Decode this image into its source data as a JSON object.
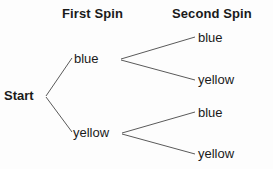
{
  "diagram": {
    "type": "probability-tree",
    "title": "",
    "background_color": "#fdfdfd",
    "line_color": "#5a5a5a",
    "text_color": "#1a1a1a"
  },
  "headers": {
    "first": "First Spin",
    "second": "Second Spin"
  },
  "nodes": {
    "root": "Start",
    "first_spin": {
      "blue": "blue",
      "yellow": "yellow"
    },
    "second_spin": {
      "from_blue": {
        "blue": "blue",
        "yellow": "yellow"
      },
      "from_yellow": {
        "blue": "blue",
        "yellow": "yellow"
      }
    }
  },
  "edges": [
    {
      "name": "start-to-blue",
      "x1": 46,
      "y1": 96,
      "x2": 72,
      "y2": 58
    },
    {
      "name": "start-to-yellow",
      "x1": 46,
      "y1": 97,
      "x2": 72,
      "y2": 132
    },
    {
      "name": "blue-to-blue",
      "x1": 121,
      "y1": 59,
      "x2": 195,
      "y2": 37
    },
    {
      "name": "blue-to-yellow",
      "x1": 121,
      "y1": 60,
      "x2": 195,
      "y2": 80
    },
    {
      "name": "yellow-to-blue",
      "x1": 122,
      "y1": 133,
      "x2": 195,
      "y2": 112
    },
    {
      "name": "yellow-to-yellow",
      "x1": 122,
      "y1": 134,
      "x2": 195,
      "y2": 154
    }
  ]
}
